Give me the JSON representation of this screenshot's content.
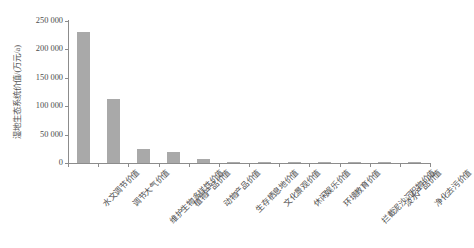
{
  "chart_data": {
    "type": "bar",
    "title": "",
    "xlabel": "",
    "ylabel": "湿地生态系统价值/(万元/a)",
    "ylim": [
      0,
      250000
    ],
    "yticks": [
      0,
      50000,
      100000,
      150000,
      200000,
      250000
    ],
    "ytick_labels": [
      "0",
      "50 000",
      "100 000",
      "150 000",
      "200 000",
      "250 000"
    ],
    "grid": false,
    "legend": "none",
    "bar_color": "#a9a9a9",
    "axis_color": "#8c8c8c",
    "categories": [
      "水文调节价值",
      "调节大气价值",
      "维护生物多样性价值",
      "植物产品价值",
      "动物产品价值",
      "生存栖息地价值",
      "文化景观价值",
      "休闲娱乐价值",
      "环境教育价值",
      "拦截泥沙沉积物价值",
      "淡水产品价值",
      "净化去污价值"
    ],
    "values": [
      231000,
      113000,
      25000,
      19000,
      7000,
      2000,
      2500,
      1500,
      1300,
      1500,
      1000,
      700
    ]
  }
}
